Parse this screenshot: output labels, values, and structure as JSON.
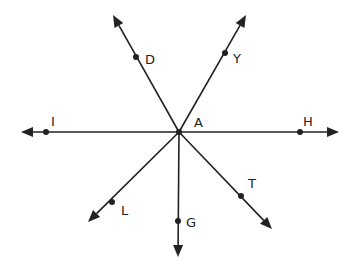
{
  "diagram": {
    "title": "",
    "stroke_color": "#222222",
    "background": "#ffffff",
    "center": {
      "name": "A",
      "x": 179,
      "y": 132,
      "label_x": 194,
      "label_y": 127
    },
    "rays": [
      {
        "id": "ray-D",
        "point": "D",
        "tip_x": 113,
        "tip_y": 15,
        "px": 136,
        "py": 57,
        "label_x": 145,
        "label_y": 64
      },
      {
        "id": "ray-Y",
        "point": "Y",
        "tip_x": 246,
        "tip_y": 15,
        "px": 225,
        "py": 53,
        "label_x": 233,
        "label_y": 63
      },
      {
        "id": "ray-I",
        "point": "I",
        "tip_x": 21,
        "tip_y": 132,
        "px": 46,
        "py": 132,
        "label_x": 51,
        "label_y": 126
      },
      {
        "id": "ray-H",
        "point": "H",
        "tip_x": 339,
        "tip_y": 132,
        "px": 300,
        "py": 132,
        "label_x": 303,
        "label_y": 126
      },
      {
        "id": "ray-L",
        "point": "L",
        "tip_x": 88,
        "tip_y": 222,
        "px": 112,
        "py": 202,
        "label_x": 121,
        "label_y": 215
      },
      {
        "id": "ray-G",
        "point": "G",
        "tip_x": 178,
        "tip_y": 257,
        "px": 178,
        "py": 221,
        "label_x": 186,
        "label_y": 227
      },
      {
        "id": "ray-T",
        "point": "T",
        "tip_x": 272,
        "tip_y": 229,
        "px": 241,
        "py": 196,
        "label_x": 248,
        "label_y": 188
      }
    ],
    "labels": {
      "A": "A",
      "D": "D",
      "Y": "Y",
      "I": "I",
      "H": "H",
      "L": "L",
      "G": "G",
      "T": "T"
    }
  }
}
